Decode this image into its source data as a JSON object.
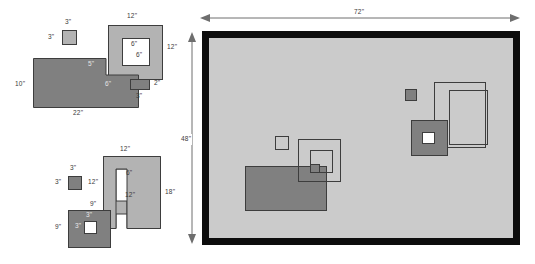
{
  "drawing": {
    "title": "Parts layout and nesting diagram",
    "units": "inches",
    "panel": {
      "name": "sheet",
      "width_label": "72\"",
      "height_label": "48\"",
      "border_color": "#0d0d0d",
      "fill_color": "#cbcbcb"
    },
    "colors": {
      "dark_fill": "#808080",
      "mid_fill": "#b3b3b3",
      "white_fill": "#ffffff",
      "stroke": "#3d3d3d",
      "dimension": "#6e6e6e"
    },
    "parts": [
      {
        "id": "small-square-top",
        "type": "square",
        "labels": [
          {
            "text": "3\"",
            "pos": "top"
          },
          {
            "text": "3\"",
            "pos": "left"
          }
        ]
      },
      {
        "id": "framed-square-top",
        "type": "square-with-hole",
        "labels": [
          {
            "text": "12\"",
            "pos": "top"
          },
          {
            "text": "12\"",
            "pos": "right"
          },
          {
            "text": "6\"",
            "pos": "inner-top"
          },
          {
            "text": "6\"",
            "pos": "inner-mid"
          }
        ]
      },
      {
        "id": "l-shape-top",
        "type": "l-polygon",
        "labels": [
          {
            "text": "10\"",
            "pos": "left"
          },
          {
            "text": "22\"",
            "pos": "bottom"
          },
          {
            "text": "5\"",
            "pos": "notch-top"
          },
          {
            "text": "6\"",
            "pos": "notch-right"
          }
        ]
      },
      {
        "id": "small-bar",
        "type": "rectangle",
        "labels": [
          {
            "text": "2\"",
            "pos": "right"
          },
          {
            "text": "3\"",
            "pos": "bottom"
          }
        ]
      },
      {
        "id": "small-square-bottom",
        "type": "square",
        "labels": [
          {
            "text": "3\"",
            "pos": "top"
          },
          {
            "text": "3\"",
            "pos": "left"
          }
        ]
      },
      {
        "id": "c-shape",
        "type": "c-polygon",
        "labels": [
          {
            "text": "12\"",
            "pos": "top"
          },
          {
            "text": "18\"",
            "pos": "right"
          },
          {
            "text": "6\"",
            "pos": "inner-top"
          },
          {
            "text": "12\"",
            "pos": "inner-mid"
          },
          {
            "text": "12\"",
            "pos": "left-upper"
          },
          {
            "text": "9\"",
            "pos": "left-lower"
          }
        ]
      },
      {
        "id": "square-with-window",
        "type": "square-with-hole",
        "labels": [
          {
            "text": "9\"",
            "pos": "left"
          },
          {
            "text": "3\"",
            "pos": "inner-top"
          },
          {
            "text": "3\"",
            "pos": "inner-left"
          }
        ]
      }
    ],
    "placed_parts": [
      {
        "id": "placed-small-square",
        "type": "outline-square"
      },
      {
        "id": "placed-nested-squares",
        "type": "nested-squares"
      },
      {
        "id": "placed-big-rect",
        "type": "filled-rectangle"
      },
      {
        "id": "placed-dark-chip",
        "type": "filled-square"
      },
      {
        "id": "placed-square-window",
        "type": "square-with-hole"
      },
      {
        "id": "placed-outline-rect-a",
        "type": "outline-rectangle"
      },
      {
        "id": "placed-outline-rect-b",
        "type": "outline-rectangle"
      }
    ]
  }
}
